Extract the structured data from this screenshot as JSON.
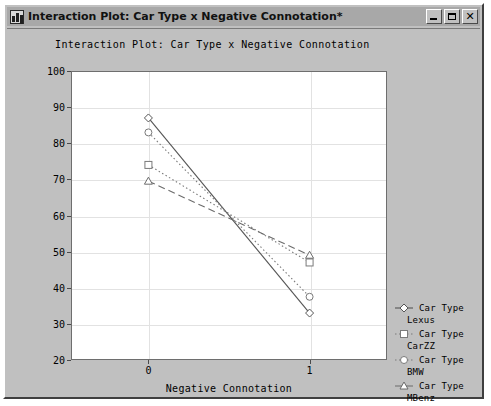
{
  "window": {
    "title": "Interaction Plot: Car Type x Negative Connotation*",
    "icon": "plot-window-icon",
    "buttons": {
      "minimize": "minimize-button",
      "maximize": "maximize-button",
      "close": "✕"
    }
  },
  "chart_data": {
    "type": "line",
    "title": "Interaction Plot: Car Type x Negative Connotation",
    "xlabel": "Negative Connotation",
    "ylabel": "Frequencies",
    "categories": [
      "0",
      "1"
    ],
    "x": [
      0,
      1
    ],
    "ylim": [
      20,
      100
    ],
    "yticks": [
      20,
      30,
      40,
      50,
      60,
      70,
      80,
      90,
      100
    ],
    "grid": true,
    "legend_position": "right",
    "series": [
      {
        "name": "Car Type Lexus",
        "label_line1": "Car Type",
        "label_line2": "Lexus",
        "values": [
          87,
          33
        ],
        "marker": "diamond",
        "linestyle": "solid",
        "color": "#555555"
      },
      {
        "name": "Car Type CarZZ",
        "label_line1": "Car Type",
        "label_line2": "CarZZ",
        "values": [
          74,
          47
        ],
        "marker": "square",
        "linestyle": "dashdot",
        "color": "#7a7a7a"
      },
      {
        "name": "Car Type BMW",
        "label_line1": "Car Type",
        "label_line2": "BMW",
        "values": [
          83,
          37.5
        ],
        "marker": "circle",
        "linestyle": "dotted",
        "color": "#7a7a7a"
      },
      {
        "name": "Car Type MBenz",
        "label_line1": "Car Type",
        "label_line2": "MBenz",
        "values": [
          69.5,
          49
        ],
        "marker": "triangle",
        "linestyle": "dashed",
        "color": "#6b6b6b"
      }
    ]
  }
}
